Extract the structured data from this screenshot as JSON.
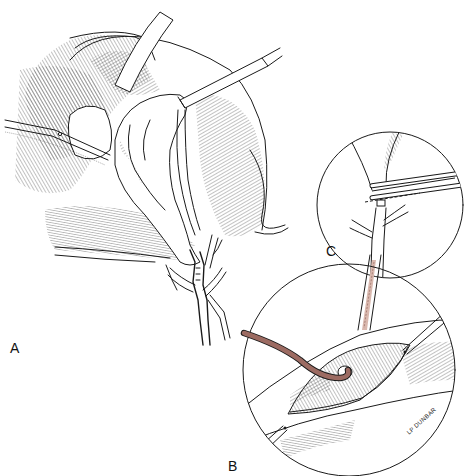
{
  "figure": {
    "panels": [
      {
        "id": "A",
        "label": "A",
        "subject": "retracted gallbladder and biliary tree with forceps"
      },
      {
        "id": "B",
        "label": "B",
        "subject": "opened common bile duct with stay sutures and catheter"
      },
      {
        "id": "C",
        "label": "C",
        "subject": "clamped cystic duct with dashed cut line"
      }
    ],
    "signature": "LP DUNBAR",
    "colors": {
      "ink": "#1a1a1a",
      "catheter": "#9c6b62",
      "catheter_light": "#d9b8ae",
      "background": "#ffffff"
    }
  }
}
